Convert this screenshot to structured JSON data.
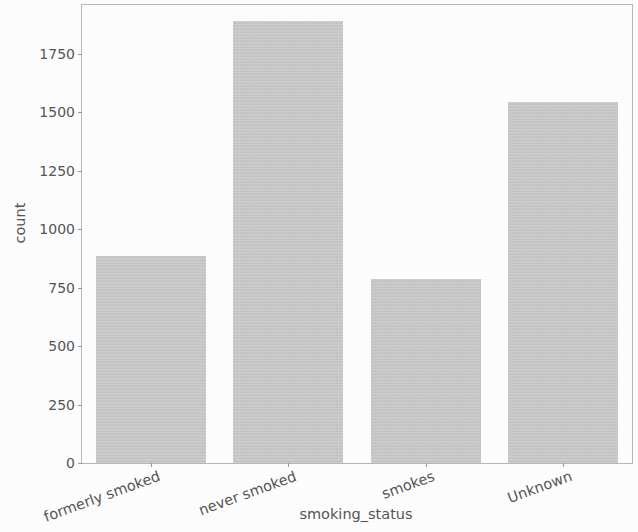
{
  "chart_data": {
    "type": "bar",
    "title": "",
    "xlabel": "smoking_status",
    "ylabel": "count",
    "categories": [
      "formerly smoked",
      "never smoked",
      "smokes",
      "Unknown"
    ],
    "values": [
      885,
      1892,
      789,
      1544
    ],
    "ylim": [
      0,
      1960
    ],
    "yticks": [
      0,
      250,
      500,
      750,
      1000,
      1250,
      1500,
      1750
    ],
    "ytick_labels": [
      "0",
      "250",
      "500",
      "750",
      "1000",
      "1250",
      "1500",
      "1750"
    ],
    "grid": false,
    "legend": null,
    "bar_color": "#c6c6c6",
    "axis_color": "#b9b9b9",
    "text_color": "#555555",
    "background_color": "#ffffff",
    "xtick_rotation": -20,
    "bar_width_fraction": 0.8
  }
}
